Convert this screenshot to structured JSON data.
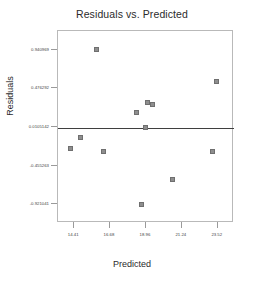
{
  "chart_data": {
    "type": "scatter",
    "title": "Residuals vs. Predicted",
    "xlabel": "Predicted",
    "ylabel": "Residuals",
    "xlim": [
      13.38,
      24.55
    ],
    "ylim": [
      -1.15,
      1.17
    ],
    "grid": false,
    "legend": null,
    "reference_line": {
      "orientation": "horizontal",
      "y": 0.0
    },
    "marker": {
      "shape": "square",
      "fill": "#8e8e8e",
      "edge": "#6f6f6f",
      "size": 5
    },
    "xticks": [
      {
        "value": 14.41,
        "label": "14.41"
      },
      {
        "value": 16.68,
        "label": "16.68"
      },
      {
        "value": 18.96,
        "label": "18.96"
      },
      {
        "value": 21.24,
        "label": "21.24"
      },
      {
        "value": 23.52,
        "label": "23.52"
      }
    ],
    "yticks": [
      {
        "value": 0.940969,
        "label": "0.940969"
      },
      {
        "value": 0.476292,
        "label": "0.476292"
      },
      {
        "value": 0.0105142,
        "label": "0.0105142"
      },
      {
        "value": -0.455263,
        "label": "-0.455263"
      },
      {
        "value": -0.921041,
        "label": "-0.921041"
      }
    ],
    "points": [
      {
        "x": 15.83,
        "y": 0.941
      },
      {
        "x": 23.41,
        "y": 0.56
      },
      {
        "x": 19.05,
        "y": 0.301
      },
      {
        "x": 19.38,
        "y": 0.279
      },
      {
        "x": 18.35,
        "y": 0.186
      },
      {
        "x": 18.95,
        "y": 0.0
      },
      {
        "x": 14.78,
        "y": -0.113
      },
      {
        "x": 14.16,
        "y": -0.248
      },
      {
        "x": 16.26,
        "y": -0.29
      },
      {
        "x": 23.17,
        "y": -0.29
      },
      {
        "x": 20.67,
        "y": -0.62
      },
      {
        "x": 18.66,
        "y": -0.921
      }
    ]
  },
  "axis_titles": {
    "x": "Predicted",
    "y": "Residuals"
  }
}
